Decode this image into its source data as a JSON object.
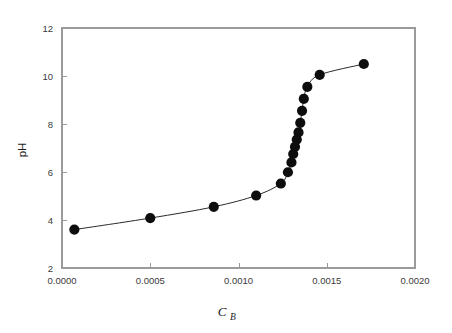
{
  "chart_data": {
    "type": "line",
    "title": "",
    "subtitle": "",
    "xlabel": "C_B",
    "xlabel_base": "C",
    "xlabel_sub": "B",
    "ylabel": "pH",
    "xlim": [
      0.0,
      0.002
    ],
    "ylim": [
      2,
      12
    ],
    "grid": false,
    "legend": null,
    "marker": "filled-circle",
    "marker_color": "#0d0d0d",
    "line_color": "#2a2a2a",
    "frame_color": "#9a9a9a",
    "xticks": [
      0.0,
      0.0005,
      0.001,
      0.0015,
      0.002
    ],
    "xtick_labels": [
      "0.0000",
      "0.0005",
      "0.0010",
      "0.0015",
      "0.0020"
    ],
    "yticks": [
      2,
      4,
      6,
      8,
      10,
      12
    ],
    "ytick_labels": [
      "2",
      "4",
      "6",
      "8",
      "10",
      "12"
    ],
    "series": [
      {
        "name": "titration curve",
        "x": [
          7e-05,
          0.0005,
          0.00086,
          0.0011,
          0.00124,
          0.00128,
          0.0013,
          0.00131,
          0.00132,
          0.00133,
          0.00134,
          0.00135,
          0.00136,
          0.00137,
          0.00139,
          0.00146,
          0.00171
        ],
        "y": [
          3.6,
          4.08,
          4.55,
          5.02,
          5.52,
          5.99,
          6.4,
          6.75,
          7.05,
          7.35,
          7.65,
          8.05,
          8.55,
          9.05,
          9.55,
          10.05,
          10.5
        ]
      }
    ]
  }
}
